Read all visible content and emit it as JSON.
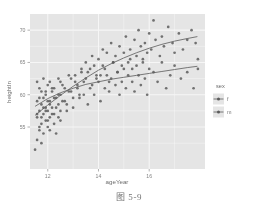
{
  "figure": {
    "caption": "图 5-9"
  },
  "chart_data": {
    "type": "scatter",
    "title": "",
    "xlabel": "ageYear",
    "ylabel": "heightIn",
    "xlim": [
      11.3,
      18.2
    ],
    "ylim": [
      48.5,
      72.5
    ],
    "xticks": [
      12,
      14,
      16
    ],
    "xtick_labels": [
      "12",
      "14",
      "16"
    ],
    "yticks": [
      55,
      60,
      65,
      70
    ],
    "ytick_labels": [
      "55",
      "60",
      "65",
      "70"
    ],
    "grid": true,
    "grid_color": "#ffffff",
    "panel_background": "#ebebeb",
    "point_color": "#4d4d4d",
    "line_color": "#4d4d4d",
    "legend": {
      "title": "sex",
      "position": "right",
      "entries": [
        {
          "label": "f",
          "key": "f"
        },
        {
          "label": "m",
          "key": "m"
        }
      ]
    },
    "series": [
      {
        "name": "f",
        "points": [
          [
            11.58,
            56.5
          ],
          [
            11.58,
            62.0
          ],
          [
            11.58,
            59.0
          ],
          [
            11.67,
            57.5
          ],
          [
            11.67,
            61.0
          ],
          [
            11.67,
            54.5
          ],
          [
            11.75,
            58.5
          ],
          [
            11.75,
            60.5
          ],
          [
            11.75,
            55.5
          ],
          [
            11.83,
            57.0
          ],
          [
            11.83,
            62.5
          ],
          [
            11.83,
            59.5
          ],
          [
            11.92,
            56.0
          ],
          [
            11.92,
            60.0
          ],
          [
            11.92,
            58.0
          ],
          [
            12.0,
            61.5
          ],
          [
            12.0,
            57.5
          ],
          [
            12.0,
            55.0
          ],
          [
            12.08,
            59.0
          ],
          [
            12.08,
            62.0
          ],
          [
            12.08,
            56.5
          ],
          [
            12.17,
            60.5
          ],
          [
            12.17,
            58.0
          ],
          [
            12.25,
            57.0
          ],
          [
            12.25,
            61.0
          ],
          [
            12.33,
            59.5
          ],
          [
            12.33,
            54.0
          ],
          [
            12.42,
            58.5
          ],
          [
            12.42,
            62.5
          ],
          [
            12.5,
            60.0
          ],
          [
            12.5,
            56.0
          ],
          [
            12.58,
            61.5
          ],
          [
            12.67,
            59.0
          ],
          [
            12.75,
            57.5
          ],
          [
            12.83,
            63.0
          ],
          [
            12.92,
            60.5
          ],
          [
            13.0,
            58.0
          ],
          [
            13.08,
            62.0
          ],
          [
            13.17,
            61.0
          ],
          [
            13.25,
            59.5
          ],
          [
            13.33,
            63.5
          ],
          [
            13.42,
            60.0
          ],
          [
            13.5,
            62.5
          ],
          [
            13.58,
            58.5
          ],
          [
            13.67,
            64.0
          ],
          [
            13.75,
            61.5
          ],
          [
            13.83,
            60.0
          ],
          [
            13.92,
            63.0
          ],
          [
            14.0,
            62.0
          ],
          [
            14.08,
            59.0
          ],
          [
            14.17,
            64.5
          ],
          [
            14.25,
            61.0
          ],
          [
            14.33,
            63.0
          ],
          [
            14.42,
            60.5
          ],
          [
            14.5,
            62.5
          ],
          [
            14.58,
            65.0
          ],
          [
            14.67,
            61.5
          ],
          [
            14.75,
            63.5
          ],
          [
            14.83,
            60.0
          ],
          [
            14.92,
            62.0
          ],
          [
            15.0,
            64.0
          ],
          [
            15.08,
            61.0
          ],
          [
            15.17,
            63.0
          ],
          [
            15.25,
            65.5
          ],
          [
            15.33,
            62.0
          ],
          [
            15.42,
            60.5
          ],
          [
            15.5,
            64.5
          ],
          [
            15.58,
            63.0
          ],
          [
            15.67,
            61.5
          ],
          [
            15.75,
            65.0
          ],
          [
            15.83,
            62.5
          ],
          [
            15.92,
            60.0
          ],
          [
            16.0,
            64.0
          ],
          [
            16.17,
            63.5
          ],
          [
            16.33,
            62.0
          ],
          [
            16.5,
            65.0
          ],
          [
            16.67,
            61.0
          ],
          [
            16.83,
            63.0
          ],
          [
            17.0,
            64.5
          ],
          [
            17.25,
            62.5
          ],
          [
            17.5,
            63.5
          ],
          [
            17.75,
            61.0
          ],
          [
            17.92,
            64.0
          ]
        ]
      },
      {
        "name": "m",
        "points": [
          [
            11.5,
            51.5
          ],
          [
            11.58,
            53.0
          ],
          [
            11.58,
            57.0
          ],
          [
            11.67,
            55.0
          ],
          [
            11.67,
            59.5
          ],
          [
            11.75,
            56.5
          ],
          [
            11.75,
            52.5
          ],
          [
            11.83,
            58.0
          ],
          [
            11.83,
            54.0
          ],
          [
            11.92,
            57.5
          ],
          [
            11.92,
            60.5
          ],
          [
            12.0,
            56.0
          ],
          [
            12.0,
            59.0
          ],
          [
            12.08,
            54.5
          ],
          [
            12.08,
            58.5
          ],
          [
            12.17,
            57.0
          ],
          [
            12.17,
            61.0
          ],
          [
            12.25,
            55.5
          ],
          [
            12.25,
            59.5
          ],
          [
            12.33,
            58.0
          ],
          [
            12.42,
            56.5
          ],
          [
            12.42,
            60.0
          ],
          [
            12.5,
            57.5
          ],
          [
            12.5,
            62.0
          ],
          [
            12.58,
            59.0
          ],
          [
            12.67,
            61.0
          ],
          [
            12.75,
            58.5
          ],
          [
            12.83,
            60.5
          ],
          [
            12.92,
            62.5
          ],
          [
            13.0,
            59.5
          ],
          [
            13.08,
            63.0
          ],
          [
            13.17,
            61.5
          ],
          [
            13.25,
            60.0
          ],
          [
            13.33,
            64.0
          ],
          [
            13.42,
            62.0
          ],
          [
            13.5,
            65.0
          ],
          [
            13.58,
            63.5
          ],
          [
            13.67,
            61.0
          ],
          [
            13.75,
            66.0
          ],
          [
            13.83,
            64.5
          ],
          [
            13.92,
            62.5
          ],
          [
            14.0,
            65.5
          ],
          [
            14.08,
            63.0
          ],
          [
            14.17,
            67.0
          ],
          [
            14.25,
            64.0
          ],
          [
            14.33,
            66.5
          ],
          [
            14.42,
            62.0
          ],
          [
            14.5,
            68.0
          ],
          [
            14.58,
            65.0
          ],
          [
            14.67,
            66.0
          ],
          [
            14.75,
            63.5
          ],
          [
            14.83,
            67.5
          ],
          [
            14.92,
            64.5
          ],
          [
            15.0,
            66.5
          ],
          [
            15.08,
            69.0
          ],
          [
            15.17,
            65.0
          ],
          [
            15.25,
            67.0
          ],
          [
            15.33,
            64.0
          ],
          [
            15.42,
            68.5
          ],
          [
            15.5,
            66.0
          ],
          [
            15.58,
            70.0
          ],
          [
            15.67,
            67.5
          ],
          [
            15.75,
            65.5
          ],
          [
            15.83,
            68.0
          ],
          [
            15.92,
            66.5
          ],
          [
            16.0,
            69.5
          ],
          [
            16.08,
            67.0
          ],
          [
            16.17,
            71.5
          ],
          [
            16.25,
            68.5
          ],
          [
            16.42,
            66.0
          ],
          [
            16.5,
            69.0
          ],
          [
            16.58,
            67.5
          ],
          [
            16.75,
            70.5
          ],
          [
            16.92,
            68.0
          ],
          [
            17.0,
            66.5
          ],
          [
            17.17,
            69.5
          ],
          [
            17.33,
            67.0
          ],
          [
            17.5,
            68.5
          ],
          [
            17.67,
            70.0
          ],
          [
            17.83,
            68.0
          ],
          [
            17.92,
            65.5
          ]
        ]
      }
    ],
    "trend_curves": [
      {
        "name": "f",
        "description": "flatter lower smooth curve",
        "points": [
          [
            11.5,
            58.2
          ],
          [
            12.0,
            59.4
          ],
          [
            12.5,
            60.3
          ],
          [
            13.0,
            61.0
          ],
          [
            13.5,
            61.6
          ],
          [
            14.0,
            62.0
          ],
          [
            14.5,
            62.4
          ],
          [
            15.0,
            62.7
          ],
          [
            15.5,
            63.0
          ],
          [
            16.0,
            63.3
          ],
          [
            16.5,
            63.6
          ],
          [
            17.0,
            63.9
          ],
          [
            17.5,
            64.2
          ],
          [
            17.9,
            64.4
          ]
        ]
      },
      {
        "name": "m",
        "description": "steeper upper smooth curve",
        "points": [
          [
            11.5,
            56.8
          ],
          [
            12.0,
            58.4
          ],
          [
            12.5,
            59.9
          ],
          [
            13.0,
            61.3
          ],
          [
            13.5,
            62.6
          ],
          [
            14.0,
            63.8
          ],
          [
            14.5,
            64.8
          ],
          [
            15.0,
            65.7
          ],
          [
            15.5,
            66.5
          ],
          [
            16.0,
            67.2
          ],
          [
            16.5,
            67.8
          ],
          [
            17.0,
            68.3
          ],
          [
            17.5,
            68.7
          ],
          [
            17.9,
            69.0
          ]
        ]
      }
    ]
  }
}
